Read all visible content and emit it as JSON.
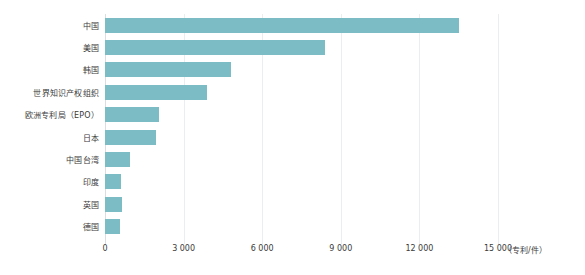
{
  "chart_data": {
    "type": "bar",
    "orientation": "horizontal",
    "title": "",
    "subtitle": "",
    "xlabel": "",
    "ylabel": "",
    "unit_label": "（专利/件）",
    "categories": [
      "中国",
      "美国",
      "韩国",
      "世界知识产权组织",
      "欧洲专利局（EPO）",
      "日本",
      "中国台湾",
      "印度",
      "英国",
      "德国"
    ],
    "values": [
      13500,
      8400,
      4800,
      3900,
      2050,
      1950,
      950,
      620,
      650,
      580
    ],
    "series": [
      {
        "name": "专利数量",
        "values": [
          13500,
          8400,
          4800,
          3900,
          2050,
          1950,
          950,
          620,
          650,
          580
        ]
      }
    ],
    "xlim": [
      0,
      15000
    ],
    "xticks": [
      0,
      3000,
      6000,
      9000,
      12000,
      15000
    ],
    "xticklabels": [
      "0",
      "3 000",
      "6 000",
      "9 000",
      "12 000",
      "15 000"
    ],
    "grid": true,
    "legend": false,
    "legend_position": "none",
    "bar_color": "#7cbcc4",
    "grid_color": "#e9eef0",
    "background_color": "#ffffff",
    "text_color": "#3b3b3b"
  }
}
